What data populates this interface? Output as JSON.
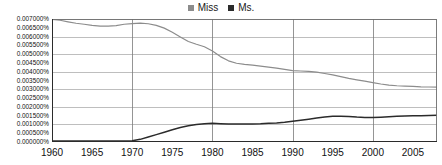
{
  "legend": {
    "position": "top-center",
    "entries": [
      {
        "label": "Miss",
        "color": "#8c8c8c",
        "marker": "square-marker-miss"
      },
      {
        "label": "Ms.",
        "color": "#2b2b2b",
        "marker": "square-marker-ms"
      }
    ]
  },
  "axes": {
    "y_tick_labels": [
      "0.007000%",
      "0.006500%",
      "0.006000%",
      "0.005500%",
      "0.005000%",
      "0.004500%",
      "0.004000%",
      "0.003500%",
      "0.003000%",
      "0.002500%",
      "0.002000%",
      "0.001500%",
      "0.001000%",
      "0.000500%",
      "0.000000%"
    ],
    "x_tick_labels": [
      "1960",
      "1965",
      "1970",
      "1975",
      "1980",
      "1985",
      "1990",
      "1995",
      "2000",
      "2005"
    ],
    "grid_value_step": 0.001,
    "grid": "horizontal-and-vertical"
  },
  "chart_data": {
    "type": "line",
    "title": "",
    "subtitle": "",
    "xlabel": "",
    "ylabel": "",
    "xlim": [
      1960,
      2008
    ],
    "ylim": [
      0.0,
      0.007
    ],
    "ytick_step": 0.0005,
    "xtick_step": 5,
    "grid": true,
    "legend_position": "top-center",
    "value_unit": "percent",
    "x": [
      1960,
      1961,
      1962,
      1963,
      1964,
      1965,
      1966,
      1967,
      1968,
      1969,
      1970,
      1971,
      1972,
      1973,
      1974,
      1975,
      1976,
      1977,
      1978,
      1979,
      1980,
      1981,
      1982,
      1983,
      1984,
      1985,
      1986,
      1987,
      1988,
      1989,
      1990,
      1991,
      1992,
      1993,
      1994,
      1995,
      1996,
      1997,
      1998,
      1999,
      2000,
      2001,
      2002,
      2003,
      2004,
      2005,
      2006,
      2007,
      2008
    ],
    "series": [
      {
        "name": "Miss",
        "color": "#8c8c8c",
        "values": [
          0.00698,
          0.00693,
          0.00684,
          0.00676,
          0.0067,
          0.00664,
          0.00659,
          0.0066,
          0.00662,
          0.0067,
          0.00674,
          0.00676,
          0.00673,
          0.00664,
          0.00648,
          0.00625,
          0.00598,
          0.00572,
          0.00556,
          0.00542,
          0.00518,
          0.00486,
          0.00462,
          0.00448,
          0.00442,
          0.00438,
          0.00432,
          0.00426,
          0.0042,
          0.00413,
          0.00406,
          0.00404,
          0.00402,
          0.00398,
          0.0039,
          0.00382,
          0.00372,
          0.00362,
          0.00354,
          0.00346,
          0.00338,
          0.0033,
          0.00324,
          0.0032,
          0.00318,
          0.00316,
          0.00314,
          0.00313,
          0.00312
        ]
      },
      {
        "name": "Ms.",
        "color": "#2b2b2b",
        "values": [
          6e-05,
          6e-05,
          6e-05,
          6e-05,
          6e-05,
          6e-05,
          6e-05,
          6e-05,
          6e-05,
          6e-05,
          7e-05,
          0.00015,
          0.00028,
          0.00042,
          0.00056,
          0.0007,
          0.00082,
          0.00092,
          0.001,
          0.00104,
          0.00106,
          0.00104,
          0.00102,
          0.00102,
          0.00102,
          0.00103,
          0.00104,
          0.00106,
          0.00108,
          0.00112,
          0.00118,
          0.00124,
          0.0013,
          0.00136,
          0.00142,
          0.00146,
          0.00147,
          0.00145,
          0.00142,
          0.0014,
          0.0014,
          0.00141,
          0.00143,
          0.00146,
          0.00148,
          0.00149,
          0.0015,
          0.00151,
          0.00152
        ]
      }
    ]
  }
}
